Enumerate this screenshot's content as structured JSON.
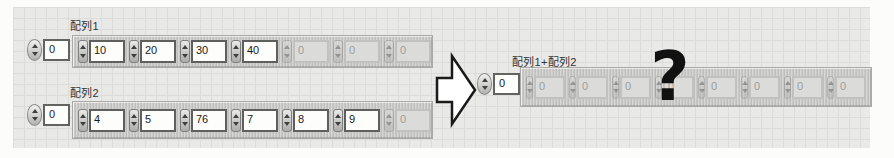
{
  "array1": {
    "label": "配列1",
    "index_value": "0",
    "elements": [
      {
        "value": "10",
        "enabled": true
      },
      {
        "value": "20",
        "enabled": true
      },
      {
        "value": "30",
        "enabled": true
      },
      {
        "value": "40",
        "enabled": true
      },
      {
        "value": "0",
        "enabled": false
      },
      {
        "value": "0",
        "enabled": false
      },
      {
        "value": "0",
        "enabled": false
      }
    ]
  },
  "array2": {
    "label": "配列2",
    "index_value": "0",
    "elements": [
      {
        "value": "4",
        "enabled": true
      },
      {
        "value": "5",
        "enabled": true
      },
      {
        "value": "76",
        "enabled": true
      },
      {
        "value": "7",
        "enabled": true
      },
      {
        "value": "8",
        "enabled": true
      },
      {
        "value": "9",
        "enabled": true
      },
      {
        "value": "0",
        "enabled": false
      }
    ]
  },
  "result": {
    "label": "配列1+配列2",
    "index_value": "0",
    "overlay_mark": "?",
    "elements": [
      {
        "value": "0",
        "enabled": false
      },
      {
        "value": "0",
        "enabled": false
      },
      {
        "value": "0",
        "enabled": false
      },
      {
        "value": "0",
        "enabled": false
      },
      {
        "value": "0",
        "enabled": false
      },
      {
        "value": "0",
        "enabled": false
      },
      {
        "value": "0",
        "enabled": false
      },
      {
        "value": "0",
        "enabled": false
      }
    ]
  },
  "icons": {
    "arrow": "right-block-arrow"
  },
  "colors": {
    "panel_background": "#e9e9e7",
    "grid_line": "#dcdcda",
    "array_shell": "#c9c9c7",
    "enabled_field_bg": "#fdfdfc",
    "enabled_text": "#1a1a1a",
    "disabled_field_bg": "#dbdbd9",
    "disabled_text": "#9d9d9b",
    "arrow_fill": "#ffffff",
    "arrow_outline": "#1a1a1a",
    "question_mark": "#111111"
  }
}
